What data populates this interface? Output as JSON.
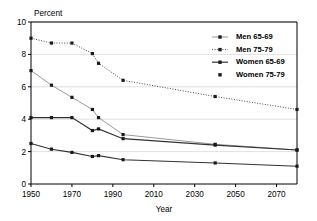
{
  "chart_data": {
    "type": "line",
    "title": "",
    "xlabel": "Year",
    "ylabel": "Percent",
    "xlim": [
      1950,
      2080
    ],
    "ylim": [
      0,
      10
    ],
    "xticks": [
      1950,
      1970,
      1990,
      2010,
      2030,
      2050,
      2070
    ],
    "yticks": [
      0,
      2,
      4,
      6,
      8,
      10
    ],
    "grid": "horizontal",
    "legend_position": "top-right",
    "series": [
      {
        "name": "Men 65-69",
        "color": "#9a9a9a",
        "style": "solid-light",
        "marker": "square",
        "x": [
          1950,
          1960,
          1970,
          1980,
          1983,
          1995,
          2040,
          2080
        ],
        "y": [
          7.0,
          6.1,
          5.35,
          4.6,
          4.1,
          3.05,
          2.45,
          2.1
        ]
      },
      {
        "name": "Men 75-79",
        "color": "#4a4a4a",
        "style": "dotted",
        "marker": "square",
        "x": [
          1950,
          1960,
          1970,
          1980,
          1983,
          1995,
          2040,
          2080
        ],
        "y": [
          9.0,
          8.7,
          8.7,
          8.05,
          7.45,
          6.4,
          5.4,
          4.6
        ]
      },
      {
        "name": "Women 65-69",
        "color": "#333333",
        "style": "solid",
        "marker": "square",
        "x": [
          1950,
          1960,
          1970,
          1980,
          1983,
          1995,
          2040,
          2080
        ],
        "y": [
          4.1,
          4.1,
          4.1,
          3.3,
          3.4,
          2.8,
          2.4,
          2.1
        ]
      },
      {
        "name": "Women 75-79",
        "color": "#333333",
        "style": "solid",
        "marker": "square",
        "x": [
          1950,
          1960,
          1970,
          1980,
          1983,
          1995,
          2040,
          2080
        ],
        "y": [
          2.5,
          2.15,
          1.95,
          1.7,
          1.75,
          1.5,
          1.3,
          1.1
        ]
      }
    ]
  },
  "axes": {
    "y_title": "Percent",
    "x_title": "Year",
    "y_tick_labels": [
      "0",
      "2",
      "4",
      "6",
      "8",
      "10"
    ],
    "x_tick_labels": [
      "1950",
      "1970",
      "1990",
      "2010",
      "2030",
      "2050",
      "2070"
    ]
  },
  "legend": {
    "items": [
      {
        "label": "Men 65-69",
        "marker": "line-marker-light"
      },
      {
        "label": "Men 75-79",
        "marker": "dotted-marker"
      },
      {
        "label": "Women 65-69",
        "marker": "line-marker-dark"
      },
      {
        "label": "Women 75-79",
        "marker": "marker-only"
      }
    ]
  },
  "colors": {
    "axis": "#000000",
    "grid": "#d8d8d8",
    "men_65_69": "#9a9a9a",
    "men_75_79": "#4a4a4a",
    "women_65_69": "#333333",
    "women_75_79": "#333333",
    "background": "#ffffff"
  }
}
